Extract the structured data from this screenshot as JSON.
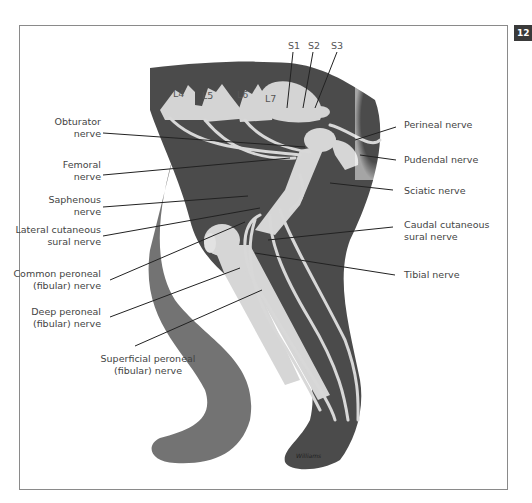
{
  "page": {
    "chapter_number": "12"
  },
  "figure": {
    "vertebrae_labels": [
      "L4",
      "L5",
      "L6",
      "L7"
    ],
    "sacral_labels": [
      "S1",
      "S2",
      "S3"
    ],
    "left_labels": [
      {
        "line1": "Obturator",
        "line2": "nerve"
      },
      {
        "line1": "Femoral",
        "line2": "nerve"
      },
      {
        "line1": "Saphenous",
        "line2": "nerve"
      },
      {
        "line1": "Lateral cutaneous",
        "line2": "sural nerve"
      },
      {
        "line1": "Common peroneal",
        "line2": "(fibular) nerve"
      },
      {
        "line1": "Deep peroneal",
        "line2": "(fibular) nerve"
      },
      {
        "line1": "Superficial peroneal",
        "line2": "(fibular) nerve"
      }
    ],
    "right_labels": [
      {
        "line1": "Perineal nerve",
        "line2": ""
      },
      {
        "line1": "Pudendal nerve",
        "line2": ""
      },
      {
        "line1": "Sciatic nerve",
        "line2": ""
      },
      {
        "line1": "Caudal cutaneous",
        "line2": "sural nerve"
      },
      {
        "line1": "Tibial nerve",
        "line2": ""
      }
    ],
    "signature": "Williams",
    "colors": {
      "body_dark": "#4a4a4a",
      "body_medium": "#6e6e6e",
      "nerve_bone": "#d8d8d8",
      "leader_line": "#222222",
      "label_text": "#444444",
      "frame": "#8a8a8a",
      "chapter_tab": "#3a3a3a"
    }
  }
}
